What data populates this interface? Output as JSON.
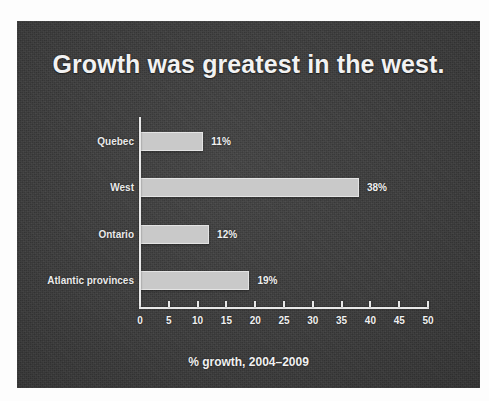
{
  "slide": {
    "title": "Growth was greatest in the west.",
    "background_color": "#3a3a3a",
    "text_color": "#f2f2f2"
  },
  "chart_data": {
    "type": "bar",
    "orientation": "horizontal",
    "title": "Growth was greatest in the west.",
    "categories": [
      "Quebec",
      "West",
      "Ontario",
      "Atlantic provinces"
    ],
    "values": [
      11,
      38,
      12,
      19
    ],
    "value_labels": [
      "11%",
      "38%",
      "12%",
      "19%"
    ],
    "xlabel": "% growth, 2004–2009",
    "ylabel": "",
    "xlim": [
      0,
      50
    ],
    "xticks": [
      0,
      5,
      10,
      15,
      20,
      25,
      30,
      35,
      40,
      45,
      50
    ],
    "xtick_labels": [
      "0",
      "5",
      "10",
      "15",
      "20",
      "25",
      "30",
      "35",
      "40",
      "45",
      "50"
    ],
    "grid": false,
    "legend": false,
    "bar_color": "#c9c9c9",
    "axis_color": "#e8e8e8"
  }
}
